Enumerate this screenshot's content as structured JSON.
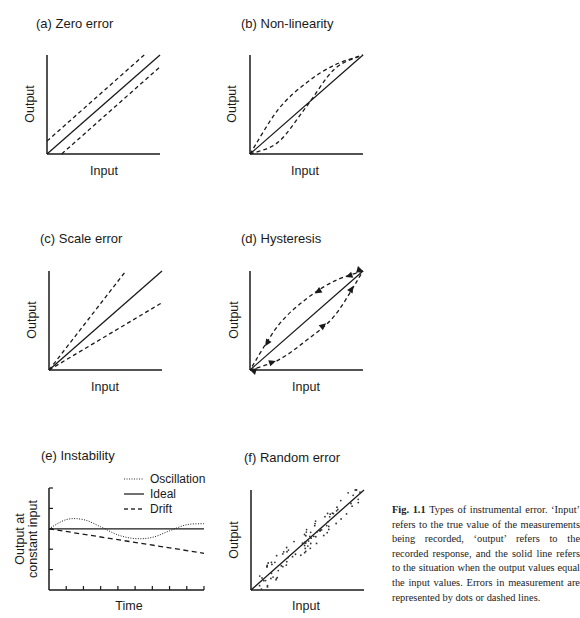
{
  "panels": [
    {
      "id": "a",
      "title": "(a) Zero error",
      "xlabel": "Input",
      "ylabel": "Output",
      "type": "line",
      "series": [
        {
          "name": "Ideal",
          "style": "solid",
          "points": [
            [
              0,
              0
            ],
            [
              1,
              1
            ]
          ]
        },
        {
          "name": "Positive offset",
          "style": "dashed",
          "points": [
            [
              0,
              0.13
            ],
            [
              0.86,
              1.0
            ]
          ]
        },
        {
          "name": "Negative offset",
          "style": "dashed",
          "points": [
            [
              0.13,
              0
            ],
            [
              1,
              0.88
            ]
          ]
        }
      ]
    },
    {
      "id": "b",
      "title": "(b) Non-linearity",
      "xlabel": "Input",
      "ylabel": "Output",
      "type": "line",
      "series": [
        {
          "name": "Ideal",
          "style": "solid",
          "points": [
            [
              0,
              0
            ],
            [
              1,
              1
            ]
          ]
        },
        {
          "name": "Concave",
          "style": "dashed",
          "shape": "bulge-up"
        },
        {
          "name": "S-shaped",
          "style": "dashed",
          "shape": "s-curve"
        }
      ]
    },
    {
      "id": "c",
      "title": "(c) Scale error",
      "xlabel": "Input",
      "ylabel": "Output",
      "type": "line",
      "series": [
        {
          "name": "Ideal",
          "style": "solid",
          "points": [
            [
              0,
              0
            ],
            [
              1,
              1
            ]
          ]
        },
        {
          "name": "High gain",
          "style": "dashed",
          "points": [
            [
              0,
              0
            ],
            [
              0.68,
              1.0
            ]
          ]
        },
        {
          "name": "Low gain",
          "style": "dashed",
          "points": [
            [
              0,
              0
            ],
            [
              1,
              0.68
            ]
          ]
        }
      ]
    },
    {
      "id": "d",
      "title": "(d) Hysteresis",
      "xlabel": "Input",
      "ylabel": "Output",
      "type": "line",
      "series": [
        {
          "name": "Ideal",
          "style": "solid",
          "points": [
            [
              0,
              0
            ],
            [
              1,
              1
            ]
          ]
        },
        {
          "name": "Increasing input",
          "style": "dashed",
          "direction": "up"
        },
        {
          "name": "Decreasing input",
          "style": "dashed",
          "direction": "down"
        }
      ]
    },
    {
      "id": "e",
      "title": "(e) Instability",
      "xlabel": "Time",
      "ylabel": "Output at constant input",
      "type": "line",
      "legend": [
        {
          "label": "Oscillation",
          "style": "dotted"
        },
        {
          "label": "Ideal",
          "style": "solid"
        },
        {
          "label": "Drift",
          "style": "dashed"
        }
      ],
      "x_ticks": 9,
      "y_ticks": 5
    },
    {
      "id": "f",
      "title": "(f) Random error",
      "xlabel": "Input",
      "ylabel": "Output",
      "type": "scatter",
      "series": [
        {
          "name": "Ideal",
          "style": "solid",
          "points": [
            [
              0,
              0
            ],
            [
              1,
              1
            ]
          ]
        },
        {
          "name": "Measurements",
          "style": "dots"
        }
      ]
    }
  ],
  "caption": {
    "label": "Fig. 1.1",
    "text": "Types of instrumental error. ‘Input’ refers to the true value of the measurements being recorded, ‘output’ refers to the recorded response, and the solid line refers to the situation when the output values equal the input values. Errors in measurement are represented by dots or dashed lines."
  },
  "chart_data": [
    {
      "type": "line",
      "title": "(a) Zero error",
      "xlabel": "Input",
      "ylabel": "Output",
      "xlim": [
        0,
        1
      ],
      "ylim": [
        0,
        1
      ],
      "series": [
        {
          "name": "Ideal",
          "x": [
            0,
            1
          ],
          "y": [
            0,
            1
          ]
        },
        {
          "name": "Positive zero offset",
          "x": [
            0,
            0.86
          ],
          "y": [
            0.13,
            1.0
          ]
        },
        {
          "name": "Negative zero offset",
          "x": [
            0.13,
            1
          ],
          "y": [
            0,
            0.88
          ]
        }
      ]
    },
    {
      "type": "line",
      "title": "(b) Non-linearity",
      "xlabel": "Input",
      "ylabel": "Output",
      "xlim": [
        0,
        1
      ],
      "ylim": [
        0,
        1
      ],
      "series": [
        {
          "name": "Ideal",
          "x": [
            0,
            1
          ],
          "y": [
            0,
            1
          ]
        },
        {
          "name": "Curve above",
          "x": [
            0,
            0.25,
            0.5,
            0.75,
            1
          ],
          "y": [
            0,
            0.45,
            0.72,
            0.9,
            1
          ]
        },
        {
          "name": "S-curve",
          "x": [
            0,
            0.25,
            0.5,
            0.75,
            1
          ],
          "y": [
            0,
            0.12,
            0.48,
            0.86,
            1
          ]
        }
      ]
    },
    {
      "type": "line",
      "title": "(c) Scale error",
      "xlabel": "Input",
      "ylabel": "Output",
      "xlim": [
        0,
        1
      ],
      "ylim": [
        0,
        1
      ],
      "series": [
        {
          "name": "Ideal",
          "x": [
            0,
            1
          ],
          "y": [
            0,
            1
          ]
        },
        {
          "name": "Gain > 1",
          "x": [
            0,
            0.68
          ],
          "y": [
            0,
            1
          ]
        },
        {
          "name": "Gain < 1",
          "x": [
            0,
            1
          ],
          "y": [
            0,
            0.68
          ]
        }
      ]
    },
    {
      "type": "line",
      "title": "(d) Hysteresis",
      "xlabel": "Input",
      "ylabel": "Output",
      "xlim": [
        0,
        1
      ],
      "ylim": [
        0,
        1
      ],
      "series": [
        {
          "name": "Ideal",
          "x": [
            0,
            1
          ],
          "y": [
            0,
            1
          ]
        },
        {
          "name": "Increasing",
          "x": [
            0,
            0.25,
            0.5,
            0.75,
            1
          ],
          "y": [
            0,
            0.1,
            0.3,
            0.55,
            1
          ]
        },
        {
          "name": "Decreasing",
          "x": [
            1,
            0.75,
            0.5,
            0.25,
            0
          ],
          "y": [
            1,
            0.9,
            0.72,
            0.45,
            0
          ]
        }
      ]
    },
    {
      "type": "line",
      "title": "(e) Instability",
      "xlabel": "Time",
      "ylabel": "Output at constant input",
      "xlim": [
        0,
        9
      ],
      "ylim": [
        -3,
        2
      ],
      "legend": [
        "Oscillation",
        "Ideal",
        "Drift"
      ],
      "legend_position": "top-right",
      "series": [
        {
          "name": "Ideal",
          "x": [
            0,
            9
          ],
          "y": [
            0,
            0
          ]
        },
        {
          "name": "Oscillation",
          "x": [
            0,
            1,
            2,
            3,
            4,
            5,
            6,
            7,
            8,
            9
          ],
          "y": [
            0,
            0.45,
            0.45,
            0.1,
            -0.3,
            -0.48,
            -0.42,
            -0.1,
            0.2,
            0.25
          ]
        },
        {
          "name": "Drift",
          "x": [
            0,
            9
          ],
          "y": [
            0,
            -1.2
          ]
        }
      ]
    },
    {
      "type": "scatter",
      "title": "(f) Random error",
      "xlabel": "Input",
      "ylabel": "Output",
      "xlim": [
        0,
        1
      ],
      "ylim": [
        0,
        1
      ],
      "series": [
        {
          "name": "Ideal",
          "x": [
            0,
            1
          ],
          "y": [
            0,
            1
          ]
        },
        {
          "name": "Measurements",
          "description": "points scattered randomly about ideal line, roughly ±0.1"
        }
      ]
    }
  ]
}
